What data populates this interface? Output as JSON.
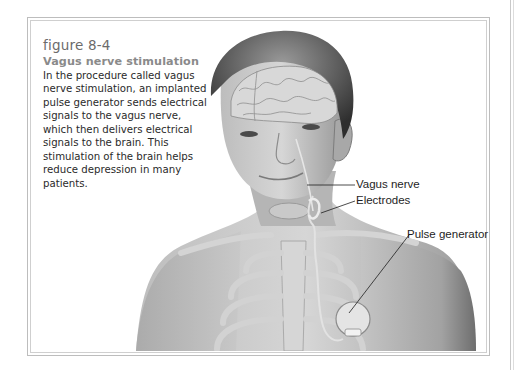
{
  "figure": {
    "number": "figure 8-4",
    "title": "Vagus nerve stimulation",
    "caption": "In the procedure called vagus nerve stimulation, an implanted pulse generator sends electrical signals to the vagus nerve, which then delivers electrical signals to the brain. This stimulation of the brain helps reduce depression in many patients."
  },
  "illustration": {
    "subject": "anatomical drawing of a man's head, neck and upper chest showing brain, vagus nerve, electrodes, ribcage and implanted pulse generator",
    "labels": {
      "vagus_nerve": "Vagus nerve",
      "electrodes": "Electrodes",
      "pulse_generator": "Pulse generator"
    }
  },
  "colors": {
    "figure_number": "#6b6b6b",
    "title": "#8a8a8a",
    "body_text": "#2a2a2a",
    "frame": "#bdbdbd"
  }
}
